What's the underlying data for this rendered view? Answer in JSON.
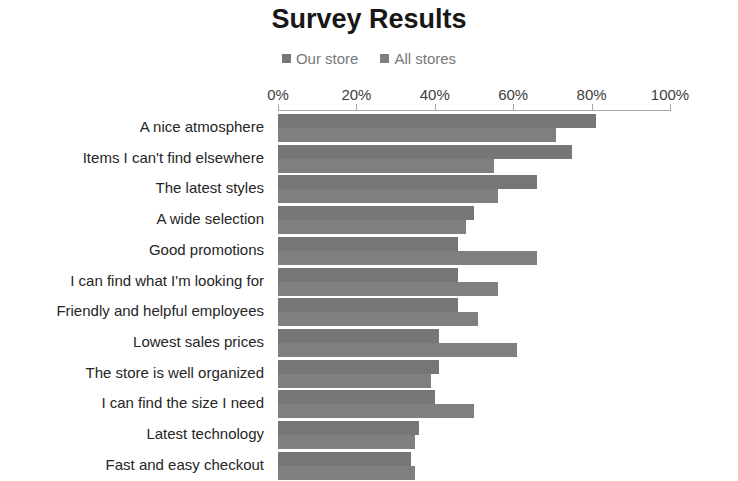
{
  "chart_data": {
    "type": "bar",
    "orientation": "horizontal",
    "grouping": "grouped",
    "title": "Survey Results",
    "xlabel": "",
    "ylabel": "",
    "xlim": [
      0,
      100
    ],
    "xtick_labels": [
      "0%",
      "20%",
      "40%",
      "60%",
      "80%",
      "100%"
    ],
    "xtick_values": [
      0,
      20,
      40,
      60,
      80,
      100
    ],
    "grid": false,
    "legend_position": "top-center",
    "legend": [
      "Our store",
      "All stores"
    ],
    "categories": [
      "A nice atmosphere",
      "Items I can't find elsewhere",
      "The latest styles",
      "A wide selection",
      "Good promotions",
      "I can find what I'm looking for",
      "Friendly and helpful employees",
      "Lowest sales prices",
      "The store is well organized",
      "I can find the size I need",
      "Latest technology",
      "Fast and easy checkout"
    ],
    "series": [
      {
        "name": "Our store",
        "color": "#767676",
        "values": [
          81,
          75,
          66,
          50,
          46,
          46,
          46,
          41,
          41,
          40,
          36,
          34
        ]
      },
      {
        "name": "All stores",
        "color": "#7f7f7f",
        "values": [
          71,
          55,
          56,
          48,
          66,
          56,
          51,
          61,
          39,
          50,
          35,
          35
        ]
      }
    ]
  },
  "colors": {
    "background": "#ffffff",
    "title_text": "#171717",
    "legend_text": "#787878",
    "category_text": "#262626",
    "tick_text": "#3d3d3d",
    "axis_line": "#a6a6a6"
  }
}
